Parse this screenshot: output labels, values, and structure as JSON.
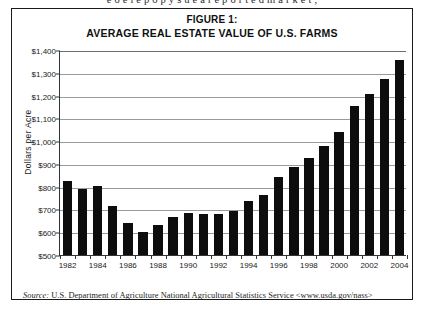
{
  "page": {
    "top_cut_text": "e  o  e  l  e  p  o  p  y  s  u  e  a  r  e  p  o  r  t  e  d  m  a  r  k  e  t  ,"
  },
  "figure": {
    "title_line1": "FIGURE 1:",
    "title_line2": "AVERAGE REAL ESTATE VALUE OF U.S. FARMS",
    "source_prefix": "Source:",
    "source_text": " U.S. Department of Agriculture National Agricultural Statistics Service <www.usda.gov/nass>"
  },
  "chart_data": {
    "type": "bar",
    "title": "FIGURE 1: AVERAGE REAL ESTATE VALUE OF U.S. FARMS",
    "xlabel": "",
    "ylabel": "Dollars  per  Acre",
    "ylim": [
      500,
      1400
    ],
    "ytick_values": [
      500,
      600,
      700,
      800,
      900,
      1000,
      1100,
      1200,
      1300,
      1400
    ],
    "ytick_labels": [
      "$500",
      "$600",
      "$700",
      "$800",
      "$900",
      "$1,000",
      "$1,100",
      "$1,200",
      "$1,300",
      "$1,400"
    ],
    "grid": true,
    "legend": "none",
    "bar_color": "#0d0d0d",
    "categories": [
      1982,
      1983,
      1984,
      1985,
      1986,
      1987,
      1988,
      1989,
      1990,
      1991,
      1992,
      1993,
      1994,
      1995,
      1996,
      1997,
      1998,
      1999,
      2000,
      2001,
      2002,
      2003,
      2004
    ],
    "xtick_labels": [
      "1982",
      "1984",
      "1986",
      "1988",
      "1990",
      "1992",
      "1994",
      "1996",
      "1998",
      "2000",
      "2002",
      "2004"
    ],
    "xtick_label_years": [
      1982,
      1984,
      1986,
      1988,
      1990,
      1992,
      1994,
      1996,
      1998,
      2000,
      2002,
      2004
    ],
    "values": [
      823,
      788,
      801,
      713,
      640,
      599,
      632,
      668,
      683,
      682,
      682,
      695,
      737,
      765,
      844,
      887,
      926,
      977,
      1040,
      1156,
      1209,
      1272,
      1358
    ]
  }
}
